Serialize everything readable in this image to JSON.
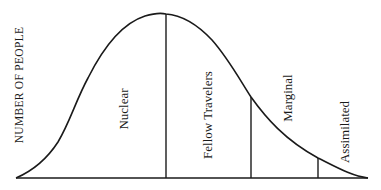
{
  "diagram": {
    "y_axis_label": "NUMBER OF PEOPLE",
    "segments": [
      {
        "label": "Nuclear"
      },
      {
        "label": "Fellow Travelers"
      },
      {
        "label": "Marginal"
      },
      {
        "label": "Assimilated"
      }
    ],
    "colors": {
      "ink": "#1a1a1a",
      "background": "#ffffff"
    }
  }
}
